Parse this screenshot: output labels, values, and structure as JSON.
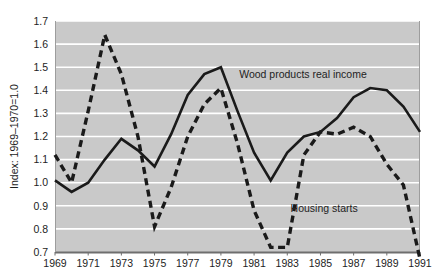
{
  "chart_data": {
    "type": "line",
    "title": "",
    "subtitle": "",
    "xlabel": "",
    "ylabel": "Index: 1969–1970=1.0",
    "xlim": [
      1969,
      1991
    ],
    "ylim": [
      0.7,
      1.7
    ],
    "grid": true,
    "grid_axis": "y",
    "legend_position": "inline-annotation",
    "x": [
      1969,
      1970,
      1971,
      1972,
      1973,
      1974,
      1975,
      1976,
      1977,
      1978,
      1979,
      1980,
      1981,
      1982,
      1983,
      1984,
      1985,
      1986,
      1987,
      1988,
      1989,
      1990,
      1991
    ],
    "ytick_labels": [
      "0.7",
      "0.8",
      "0.9",
      "1.0",
      "1.1",
      "1.2",
      "1.3",
      "1.4",
      "1.5",
      "1.6",
      "1.7"
    ],
    "ytick_values": [
      0.7,
      0.8,
      0.9,
      1.0,
      1.1,
      1.2,
      1.3,
      1.4,
      1.5,
      1.6,
      1.7
    ],
    "xtick_labels": [
      "1969",
      "1971",
      "1973",
      "1975",
      "1977",
      "1979",
      "1981",
      "1983",
      "1985",
      "1987",
      "1989",
      "1991"
    ],
    "xtick_values": [
      1969,
      1971,
      1973,
      1975,
      1977,
      1979,
      1981,
      1983,
      1985,
      1987,
      1989,
      1991
    ],
    "series": [
      {
        "name": "Wood products real income",
        "style": "solid",
        "color": "#1a1a1a",
        "label_x": 1980.1,
        "label_y": 1.452,
        "values": [
          1.01,
          0.96,
          1.0,
          1.1,
          1.19,
          1.14,
          1.07,
          1.21,
          1.38,
          1.47,
          1.5,
          1.31,
          1.13,
          1.01,
          1.13,
          1.2,
          1.22,
          1.28,
          1.37,
          1.41,
          1.4,
          1.33,
          1.22
        ]
      },
      {
        "name": "Housing starts",
        "style": "dashed",
        "color": "#1a1a1a",
        "label_x": 1983.2,
        "label_y": 0.875,
        "values": [
          1.12,
          1.0,
          1.31,
          1.64,
          1.47,
          1.2,
          0.81,
          0.98,
          1.2,
          1.34,
          1.41,
          1.17,
          0.88,
          0.72,
          0.72,
          1.12,
          1.22,
          1.21,
          1.24,
          1.2,
          1.08,
          0.99,
          0.67
        ]
      }
    ]
  },
  "axis": {
    "y_title": "Index: 1969–1970=1.0"
  },
  "colors": {
    "plot_background": "#c9c9c9",
    "page_background": "#ffffff",
    "gridline": "#ffffff",
    "axis_line": "#6e6e6e",
    "line": "#1a1a1a",
    "text": "#1d1d1d"
  }
}
